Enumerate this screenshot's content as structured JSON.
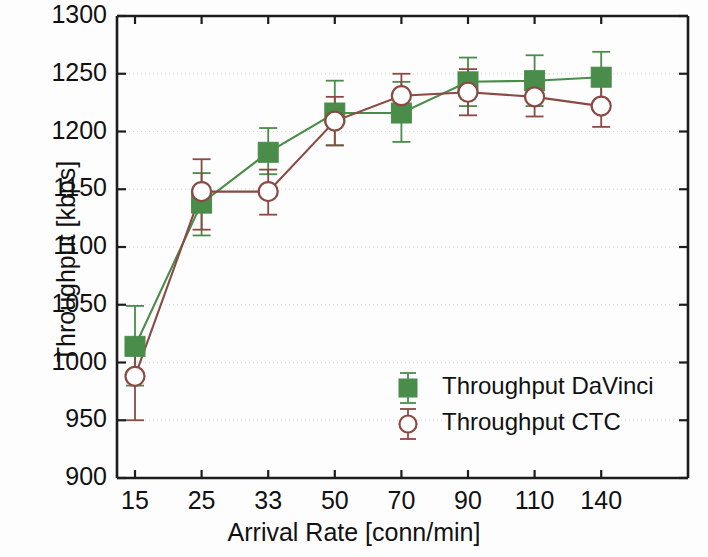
{
  "chart_data": {
    "type": "line",
    "title": "",
    "xlabel": "Arrival Rate [conn/min]",
    "ylabel": "Throughput [kbps]",
    "categories": [
      "15",
      "25",
      "33",
      "50",
      "70",
      "90",
      "110",
      "140"
    ],
    "xtick_labels": [
      "15",
      "25",
      "33",
      "50",
      "70",
      "90",
      "110",
      "140"
    ],
    "ytick_labels": [
      "900",
      "950",
      "1000",
      "1050",
      "1100",
      "1150",
      "1200",
      "1250",
      "1300"
    ],
    "ytick_values": [
      900,
      950,
      1000,
      1050,
      1100,
      1150,
      1200,
      1250,
      1300
    ],
    "ylim": [
      900,
      1300
    ],
    "grid": true,
    "grid_axis": "y",
    "legend_position": "lower-right",
    "series": [
      {
        "name": "Throughput DaVinci",
        "color": "#4a8c4a",
        "marker": "filled-square",
        "values": [
          1014,
          1138,
          1182,
          1216,
          1216,
          1243,
          1244,
          1247
        ],
        "err_low": [
          34,
          28,
          19,
          28,
          25,
          21,
          22,
          22
        ],
        "err_high": [
          35,
          26,
          21,
          28,
          27,
          21,
          22,
          22
        ]
      },
      {
        "name": "Throughput CTC",
        "color": "#8a4a43",
        "marker": "open-circle",
        "values": [
          988,
          1148,
          1148,
          1209,
          1231,
          1234,
          1230,
          1222
        ],
        "err_low": [
          38,
          33,
          20,
          21,
          19,
          20,
          17,
          18
        ],
        "err_high": [
          22,
          28,
          19,
          21,
          19,
          20,
          17,
          18
        ]
      }
    ]
  },
  "legend": {
    "items": [
      {
        "label": "Throughput DaVinci"
      },
      {
        "label": "Throughput CTC"
      }
    ]
  },
  "axes": {
    "x_title": "Arrival Rate [conn/min]",
    "y_title": "Throughput [kbps]"
  }
}
